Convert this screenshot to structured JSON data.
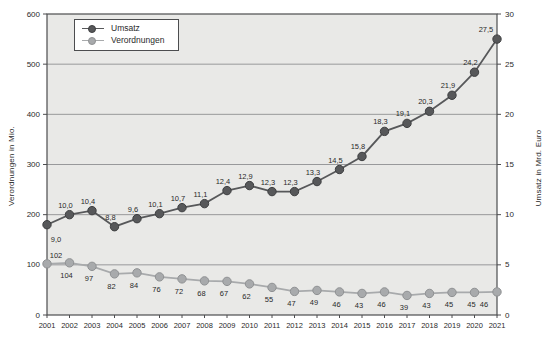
{
  "chart_data": {
    "type": "line",
    "title": "",
    "categories": [
      "2001",
      "2002",
      "2003",
      "2004",
      "2005",
      "2006",
      "2007",
      "2008",
      "2009",
      "2010",
      "2011",
      "2012",
      "2013",
      "2014",
      "2015",
      "2016",
      "2017",
      "2018",
      "2019",
      "2020",
      "2021"
    ],
    "series": [
      {
        "name": "Umsatz",
        "axis": "right",
        "color": "#57585a",
        "marker_edge": "#3e3f41",
        "values": [
          9.0,
          10.0,
          10.4,
          8.8,
          9.6,
          10.1,
          10.7,
          11.1,
          12.4,
          12.9,
          12.3,
          12.3,
          13.3,
          14.5,
          15.8,
          18.3,
          19.1,
          20.3,
          21.9,
          24.2,
          27.5
        ],
        "labels": [
          "9,0",
          "10,0",
          "10,4",
          "8,8",
          "9,6",
          "10,1",
          "10,7",
          "11,1",
          "12,4",
          "12,9",
          "12,3",
          "12,3",
          "13,3",
          "14,5",
          "15,8",
          "18,3",
          "19,1",
          "20,3",
          "21,9",
          "24,2",
          "27,5"
        ]
      },
      {
        "name": "Verordnungen",
        "axis": "left",
        "color": "#a8aaac",
        "marker_edge": "#8f9193",
        "values": [
          102,
          104,
          97,
          82,
          84,
          76,
          72,
          68,
          67,
          62,
          55,
          47,
          49,
          46,
          43,
          46,
          39,
          43,
          45,
          45,
          46
        ],
        "labels": [
          "102",
          "104",
          "97",
          "82",
          "84",
          "76",
          "72",
          "68",
          "67",
          "62",
          "55",
          "47",
          "49",
          "46",
          "43",
          "46",
          "39",
          "43",
          "45",
          "45",
          "46"
        ]
      }
    ],
    "ylabel_left": "Verordnungen in Mio.",
    "ylabel_right": "Umsatz  in Mrd. Euro",
    "xlabel": "",
    "left_axis": {
      "min": 0,
      "max": 600,
      "tick_step": 100,
      "ticks": [
        "0",
        "100",
        "200",
        "300",
        "400",
        "500",
        "600"
      ]
    },
    "right_axis": {
      "min": 0,
      "max": 30,
      "tick_step": 5,
      "ticks": [
        "0",
        "5",
        "10",
        "15",
        "20",
        "25",
        "30"
      ]
    },
    "grid": "horizontal",
    "legend_position": "top-left",
    "colors": {
      "plot_bg": "#e9e9e7",
      "grid": "#8f9092",
      "frame": "#4c4d4f",
      "text": "#2a2a2a",
      "page_bg": "#ffffff"
    }
  }
}
